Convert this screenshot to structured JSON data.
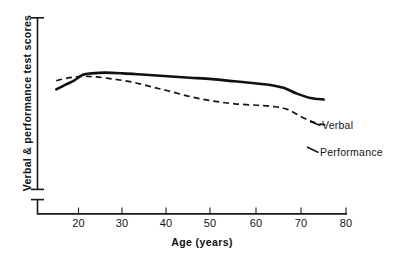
{
  "chart_data": {
    "type": "line",
    "title": "",
    "subtitle": "",
    "xlabel": "Age  (years)",
    "ylabel": "Verbal & performance test scores",
    "xlim": [
      12,
      82
    ],
    "ylim": [
      0,
      100
    ],
    "grid": false,
    "legend_position": "right-inline-labels",
    "x_ticks": [
      "20",
      "30",
      "40",
      "50",
      "60",
      "70",
      "80"
    ],
    "x_tick_values": [
      20,
      30,
      40,
      50,
      60,
      70,
      80
    ],
    "y_ticks": [],
    "y_axis_has_break": true,
    "y_axis_unlabeled": true,
    "annotations": [
      {
        "text": "Verbal",
        "at_x": 75,
        "at_y": 62
      },
      {
        "text": "Performance",
        "at_x": 74,
        "at_y": 44
      }
    ],
    "series": [
      {
        "name": "Verbal",
        "style": "solid",
        "color": "#111111",
        "x": [
          15,
          17,
          19,
          21,
          23,
          26,
          30,
          35,
          40,
          45,
          50,
          55,
          60,
          63,
          66,
          69,
          72,
          75
        ],
        "values": [
          66,
          69,
          72,
          76,
          77,
          77.5,
          77,
          76,
          75,
          74,
          73,
          71.5,
          70,
          69,
          67,
          63,
          60,
          59
        ]
      },
      {
        "name": "Performance",
        "style": "dashed",
        "color": "#151515",
        "x": [
          15,
          18,
          21,
          24,
          28,
          32,
          36,
          40,
          45,
          50,
          55,
          60,
          64,
          67,
          70,
          73,
          76
        ],
        "values": [
          72,
          74,
          75,
          74.5,
          73,
          71,
          68,
          65,
          61,
          58,
          56,
          55,
          54,
          52,
          47,
          43,
          41
        ]
      }
    ]
  },
  "axes": {
    "x_tick_labels": [
      {
        "label": "20"
      },
      {
        "label": "30"
      },
      {
        "label": "40"
      },
      {
        "label": "50"
      },
      {
        "label": "60"
      },
      {
        "label": "70"
      },
      {
        "label": "80"
      }
    ],
    "x_title": "Age  (years)",
    "y_title": "Verbal & performance test scores"
  },
  "labels": {
    "verbal": "Verbal",
    "performance": "Performance"
  }
}
